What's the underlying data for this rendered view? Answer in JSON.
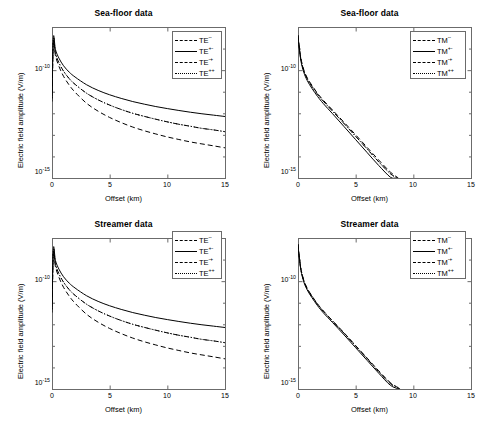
{
  "figure": {
    "width": 493,
    "height": 424,
    "background": "#ffffff",
    "axis_color": "#6b6b6b",
    "curve_color": "#000000"
  },
  "chart_data": [
    {
      "id": "top-left",
      "type": "line",
      "title": "Sea-floor  data",
      "xlabel": "Offset (km)",
      "ylabel": "Electric field amplitude (V/m)",
      "xlim": [
        0,
        15
      ],
      "ylim": [
        1e-15,
        1e-08
      ],
      "yscale": "log",
      "xticks": [
        0,
        5,
        10,
        15
      ],
      "xticklabels": [
        "0",
        "5",
        "10",
        "15"
      ],
      "yticks": [
        1e-10,
        1e-15
      ],
      "yticklabels": [
        "10⁻¹⁰",
        "10⁻¹⁵"
      ],
      "grid": false,
      "legend_position": "upper right",
      "series": [
        {
          "name": "TE⁻⁻",
          "label_base": "TE",
          "label_sup": "--",
          "style": "dashdot",
          "x": [
            0,
            0.12,
            0.3,
            0.6,
            1,
            1.5,
            2,
            3,
            4,
            5,
            6,
            7,
            8,
            9,
            10,
            11,
            12,
            13,
            14,
            15
          ],
          "y": [
            5e-12,
            2.5e-09,
            6e-10,
            2.2e-10,
            9e-11,
            4e-11,
            2.2e-11,
            8.5e-12,
            4.2e-12,
            2.4e-12,
            1.5e-12,
            1e-12,
            7.2e-13,
            5.3e-13,
            4e-13,
            3.1e-13,
            2.5e-13,
            2e-13,
            1.7e-13,
            1.4e-13
          ]
        },
        {
          "name": "TE⁺⁻",
          "label_base": "TE",
          "label_sup": "+-",
          "style": "solid",
          "x": [
            0,
            0.12,
            0.3,
            0.6,
            1,
            1.5,
            2,
            3,
            4,
            5,
            6,
            7,
            8,
            9,
            10,
            11,
            12,
            13,
            14,
            15
          ],
          "y": [
            6e-12,
            3.2e-09,
            9e-10,
            3.6e-10,
            1.6e-10,
            8e-11,
            4.8e-11,
            2.1e-11,
            1.15e-11,
            7.2e-12,
            4.9e-12,
            3.5e-12,
            2.65e-12,
            2.05e-12,
            1.65e-12,
            1.35e-12,
            1.12e-12,
            9.5e-13,
            8.2e-13,
            7.1e-13
          ]
        },
        {
          "name": "TE⁻⁺",
          "label_base": "TE",
          "label_sup": "-+",
          "style": "dashed",
          "x": [
            0,
            0.12,
            0.3,
            0.6,
            1,
            1.5,
            2,
            3,
            4,
            5,
            6,
            7,
            8,
            9,
            10,
            11,
            12,
            13,
            14,
            15
          ],
          "y": [
            3.5e-12,
            2e-09,
            4.6e-10,
            1.5e-10,
            5.2e-11,
            2e-11,
            9.5e-12,
            2.9e-12,
            1.25e-12,
            6.4e-13,
            3.7e-13,
            2.3e-13,
            1.55e-13,
            1.1e-13,
            8e-14,
            6.1e-14,
            4.7e-14,
            3.8e-14,
            3.1e-14,
            2.5e-14
          ]
        },
        {
          "name": "TE⁺⁺",
          "label_base": "TE",
          "label_sup": "++",
          "style": "dotted",
          "x": [
            0,
            0.12,
            0.3,
            0.6,
            1,
            1.5,
            2,
            3,
            4,
            5,
            6,
            7,
            8,
            9,
            10,
            11,
            12,
            13,
            14,
            15
          ],
          "y": [
            5e-12,
            2.5e-09,
            6e-10,
            2.2e-10,
            9e-11,
            4e-11,
            2.2e-11,
            8.5e-12,
            4.2e-12,
            2.4e-12,
            1.5e-12,
            1e-12,
            7.2e-13,
            5.3e-13,
            4e-13,
            3.1e-13,
            2.5e-13,
            2e-13,
            1.7e-13,
            1.4e-13
          ]
        }
      ]
    },
    {
      "id": "top-right",
      "type": "line",
      "title": "Sea-floor  data",
      "xlabel": "Offset (km)",
      "ylabel": "Electric field amplitude (V/m)",
      "xlim": [
        0,
        15
      ],
      "ylim": [
        1e-15,
        1e-08
      ],
      "yscale": "log",
      "xticks": [
        0,
        5,
        10,
        15
      ],
      "xticklabels": [
        "0",
        "5",
        "10",
        "15"
      ],
      "yticks": [
        1e-10,
        1e-15
      ],
      "yticklabels": [
        "10⁻¹⁰",
        "10⁻¹⁵"
      ],
      "grid": false,
      "legend_position": "upper right",
      "series": [
        {
          "name": "TM⁻⁻",
          "label_base": "TM",
          "label_sup": "--",
          "style": "dashdot",
          "x": [
            0,
            0.1,
            0.25,
            0.5,
            0.8,
            1.2,
            1.7,
            2.2,
            3,
            4,
            5,
            6,
            7,
            8,
            8.6
          ],
          "y": [
            4e-09,
            1.3e-09,
            3.2e-10,
            9.5e-11,
            4e-11,
            1.8e-11,
            7.5e-12,
            3.6e-12,
            1.25e-12,
            3.3e-13,
            8.5e-14,
            2.2e-14,
            5.6e-15,
            1.6e-15,
            1e-15
          ]
        },
        {
          "name": "TM⁺⁻",
          "label_base": "TM",
          "label_sup": "+-",
          "style": "solid",
          "x": [
            0,
            0.1,
            0.25,
            0.5,
            0.8,
            1.2,
            1.7,
            2.2,
            3,
            4,
            5,
            6,
            7,
            8,
            8.45
          ],
          "y": [
            3.6e-09,
            1.1e-09,
            2.7e-10,
            8e-11,
            3.3e-11,
            1.45e-11,
            6e-12,
            2.8e-12,
            9.5e-13,
            2.4e-13,
            6e-14,
            1.5e-14,
            3.8e-15,
            1.1e-15,
            1e-15
          ]
        },
        {
          "name": "TM⁻⁺",
          "label_base": "TM",
          "label_sup": "-+",
          "style": "dashed",
          "x": [
            0,
            0.1,
            0.25,
            0.5,
            0.8,
            1.2,
            1.7,
            2.2,
            3,
            4,
            5,
            6,
            7,
            8,
            8.7
          ],
          "y": [
            4.2e-09,
            1.4e-09,
            3.5e-10,
            1.05e-10,
            4.4e-11,
            2e-11,
            8.3e-12,
            4e-12,
            1.4e-12,
            3.8e-13,
            1e-13,
            2.6e-14,
            6.8e-15,
            1.9e-15,
            1e-15
          ]
        },
        {
          "name": "TM⁺⁺",
          "label_base": "TM",
          "label_sup": "++",
          "style": "dotted",
          "x": [
            0,
            0.1,
            0.25,
            0.5,
            0.8,
            1.2,
            1.7,
            2.2,
            3,
            4,
            5,
            6,
            7,
            8,
            8.6
          ],
          "y": [
            4e-09,
            1.3e-09,
            3.2e-10,
            9.5e-11,
            4e-11,
            1.8e-11,
            7.5e-12,
            3.6e-12,
            1.25e-12,
            3.3e-13,
            8.5e-14,
            2.2e-14,
            5.6e-15,
            1.6e-15,
            1e-15
          ]
        }
      ]
    },
    {
      "id": "bottom-left",
      "type": "line",
      "title": "Streamer data",
      "xlabel": "Offset (km)",
      "ylabel": "Electric field amplitude (V/m)",
      "xlim": [
        0,
        15
      ],
      "ylim": [
        1e-15,
        1e-08
      ],
      "yscale": "log",
      "xticks": [
        0,
        5,
        10,
        15
      ],
      "xticklabels": [
        "0",
        "5",
        "10",
        "15"
      ],
      "yticks": [
        1e-10,
        1e-15
      ],
      "yticklabels": [
        "10⁻¹⁰",
        "10⁻¹⁵"
      ],
      "grid": false,
      "legend_position": "upper right",
      "series": [
        {
          "name": "TE⁻⁻",
          "label_base": "TE",
          "label_sup": "--",
          "style": "dashdot",
          "x": [
            0,
            0.12,
            0.3,
            0.6,
            1,
            1.5,
            2,
            3,
            4,
            5,
            6,
            7,
            8,
            9,
            10,
            11,
            12,
            13,
            14,
            15
          ],
          "y": [
            5e-12,
            2.5e-09,
            6e-10,
            2.2e-10,
            9e-11,
            4e-11,
            2.2e-11,
            8.5e-12,
            4.2e-12,
            2.4e-12,
            1.5e-12,
            1e-12,
            7.2e-13,
            5.3e-13,
            4e-13,
            3.1e-13,
            2.5e-13,
            2e-13,
            1.7e-13,
            1.4e-13
          ]
        },
        {
          "name": "TE⁺⁻",
          "label_base": "TE",
          "label_sup": "+-",
          "style": "solid",
          "x": [
            0,
            0.12,
            0.3,
            0.6,
            1,
            1.5,
            2,
            3,
            4,
            5,
            6,
            7,
            8,
            9,
            10,
            11,
            12,
            13,
            14,
            15
          ],
          "y": [
            6e-12,
            3.2e-09,
            9e-10,
            3.6e-10,
            1.6e-10,
            8e-11,
            4.8e-11,
            2.1e-11,
            1.15e-11,
            7.2e-12,
            4.9e-12,
            3.5e-12,
            2.65e-12,
            2.05e-12,
            1.65e-12,
            1.35e-12,
            1.12e-12,
            9.5e-13,
            8.2e-13,
            7.1e-13
          ]
        },
        {
          "name": "TE⁻⁺",
          "label_base": "TE",
          "label_sup": "-+",
          "style": "dashed",
          "x": [
            0,
            0.12,
            0.3,
            0.6,
            1,
            1.5,
            2,
            3,
            4,
            5,
            6,
            7,
            8,
            9,
            10,
            11,
            12,
            13,
            14,
            15
          ],
          "y": [
            3.5e-12,
            2e-09,
            4.6e-10,
            1.5e-10,
            5.2e-11,
            2e-11,
            9.5e-12,
            2.9e-12,
            1.25e-12,
            6.4e-13,
            3.7e-13,
            2.3e-13,
            1.55e-13,
            1.1e-13,
            8e-14,
            6.1e-14,
            4.7e-14,
            3.8e-14,
            3.1e-14,
            2.5e-14
          ]
        },
        {
          "name": "TE⁺⁺",
          "label_base": "TE",
          "label_sup": "++",
          "style": "dotted",
          "x": [
            0,
            0.12,
            0.3,
            0.6,
            1,
            1.5,
            2,
            3,
            4,
            5,
            6,
            7,
            8,
            9,
            10,
            11,
            12,
            13,
            14,
            15
          ],
          "y": [
            5e-12,
            2.5e-09,
            6e-10,
            2.2e-10,
            9e-11,
            4e-11,
            2.2e-11,
            8.5e-12,
            4.2e-12,
            2.4e-12,
            1.5e-12,
            1e-12,
            7.2e-13,
            5.3e-13,
            4e-13,
            3.1e-13,
            2.5e-13,
            2e-13,
            1.7e-13,
            1.4e-13
          ]
        }
      ]
    },
    {
      "id": "bottom-right",
      "type": "line",
      "title": "Streamer data",
      "xlabel": "Offset (km)",
      "ylabel": "Electric field amplitude (V/m)",
      "xlim": [
        0,
        15
      ],
      "ylim": [
        1e-15,
        1e-08
      ],
      "yscale": "log",
      "xticks": [
        0,
        5,
        10,
        15
      ],
      "xticklabels": [
        "0",
        "5",
        "10",
        "15"
      ],
      "yticks": [
        1e-10,
        1e-15
      ],
      "yticklabels": [
        "10⁻¹⁰",
        "10⁻¹⁵"
      ],
      "grid": false,
      "legend_position": "upper right",
      "series": [
        {
          "name": "TM⁻⁻",
          "label_base": "TM",
          "label_sup": "--",
          "style": "dashdot",
          "x": [
            0,
            0.1,
            0.25,
            0.5,
            0.8,
            1.2,
            1.7,
            2.2,
            3,
            4,
            5,
            6,
            7,
            8,
            8.85
          ],
          "y": [
            5e-09,
            1.5e-09,
            3.6e-10,
            1.05e-10,
            4.4e-11,
            2e-11,
            8.3e-12,
            4e-12,
            1.4e-12,
            3.8e-13,
            9.8e-14,
            2.5e-14,
            6.4e-15,
            1.8e-15,
            1e-15
          ]
        },
        {
          "name": "TM⁺⁻",
          "label_base": "TM",
          "label_sup": "+-",
          "style": "solid",
          "x": [
            0,
            0.1,
            0.25,
            0.5,
            0.8,
            1.2,
            1.7,
            2.2,
            3,
            4,
            5,
            6,
            7,
            8,
            8.75
          ],
          "y": [
            4.6e-09,
            1.35e-09,
            3.2e-10,
            9.3e-11,
            3.9e-11,
            1.75e-11,
            7.2e-12,
            3.4e-12,
            1.2e-12,
            3.2e-13,
            8.2e-14,
            2.1e-14,
            5.4e-15,
            1.5e-15,
            1e-15
          ]
        },
        {
          "name": "TM⁻⁺",
          "label_base": "TM",
          "label_sup": "-+",
          "style": "dashed",
          "x": [
            0,
            0.1,
            0.25,
            0.5,
            0.8,
            1.2,
            1.7,
            2.2,
            3,
            4,
            5,
            6,
            7,
            8,
            8.9
          ],
          "y": [
            5.2e-09,
            1.6e-09,
            3.8e-10,
            1.1e-10,
            4.6e-11,
            2.1e-11,
            8.7e-12,
            4.2e-12,
            1.45e-12,
            4e-13,
            1.03e-13,
            2.7e-14,
            7e-15,
            2e-15,
            1e-15
          ]
        },
        {
          "name": "TM⁺⁺",
          "label_base": "TM",
          "label_sup": "++",
          "style": "dotted",
          "x": [
            0,
            0.1,
            0.25,
            0.5,
            0.8,
            1.2,
            1.7,
            2.2,
            3,
            4,
            5,
            6,
            7,
            8,
            8.85
          ],
          "y": [
            5e-09,
            1.5e-09,
            3.6e-10,
            1.05e-10,
            4.4e-11,
            2e-11,
            8.3e-12,
            4e-12,
            1.4e-12,
            3.8e-13,
            9.8e-14,
            2.5e-14,
            6.4e-15,
            1.8e-15,
            1e-15
          ]
        }
      ]
    }
  ]
}
